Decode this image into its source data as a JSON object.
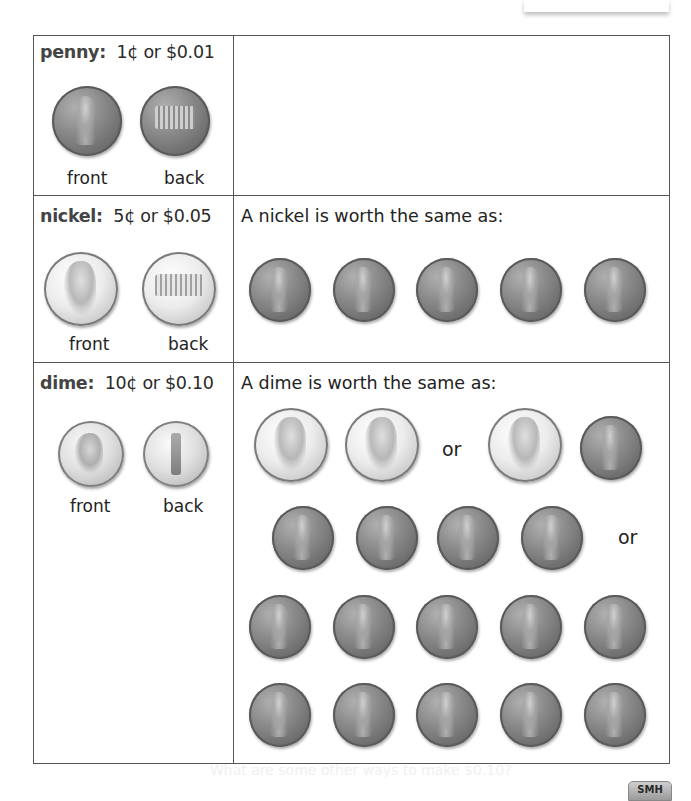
{
  "penny": {
    "name": "penny:",
    "value": "1¢ or $0.01",
    "front_label": "front",
    "back_label": "back"
  },
  "nickel": {
    "name": "nickel:",
    "value": "5¢ or $0.05",
    "front_label": "front",
    "back_label": "back",
    "prompt": "A nickel is worth the same as:",
    "equivalents": [
      {
        "coins": [
          "penny",
          "penny",
          "penny",
          "penny",
          "penny"
        ]
      }
    ]
  },
  "dime": {
    "name": "dime:",
    "value": "10¢ or $0.10",
    "front_label": "front",
    "back_label": "back",
    "prompt": "A dime is worth the same as:",
    "or_label": "or",
    "equivalents": [
      {
        "coins": [
          "nickel",
          "nickel"
        ]
      },
      {
        "coins": [
          "nickel",
          "penny",
          "penny",
          "penny",
          "penny",
          "penny"
        ]
      },
      {
        "coins": [
          "penny",
          "penny",
          "penny",
          "penny",
          "penny",
          "penny",
          "penny",
          "penny",
          "penny",
          "penny"
        ]
      }
    ]
  },
  "footer": {
    "faded_text": "What are some other ways to make $0.10?",
    "badge": "SMH"
  }
}
